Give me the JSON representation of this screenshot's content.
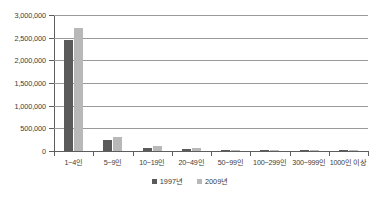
{
  "chart_data": {
    "type": "bar",
    "title": "",
    "subtitle": "",
    "xlabel": "",
    "ylabel": "",
    "grid": true,
    "legend_position": "bottom-center",
    "categories": [
      "1~4인",
      "5~9인",
      "10~19인",
      "20~49인",
      "50~99인",
      "100~299인",
      "300~999인",
      "1000인 이상"
    ],
    "ylim": [
      0,
      3000000
    ],
    "ytick_values": [
      0,
      500000,
      1000000,
      1500000,
      2000000,
      2500000,
      3000000
    ],
    "ytick_labels": [
      "0",
      "500,000",
      "1,000,000",
      "1,500,000",
      "2,000,000",
      "2,500,000",
      "3,000,000"
    ],
    "series": [
      {
        "name": "1997년",
        "color": "#5a5a5a",
        "values": [
          2450000,
          245000,
          72000,
          48000,
          17000,
          9000,
          2500,
          800
        ]
      },
      {
        "name": "2009년",
        "color": "#b8b8b8",
        "values": [
          2720000,
          320000,
          110000,
          62000,
          20000,
          10000,
          2800,
          900
        ]
      }
    ]
  },
  "legend": {
    "items": [
      {
        "label": "1997년",
        "color": "#5a5a5a"
      },
      {
        "label": "2009년",
        "color": "#b8b8b8"
      }
    ]
  },
  "colors": {
    "series_1997": "#5a5a5a",
    "series_2009": "#b8b8b8",
    "gridline": "#9a9a9a",
    "axis": "#5d5d5d",
    "text": "#3b3b3b",
    "background": "#ffffff"
  }
}
